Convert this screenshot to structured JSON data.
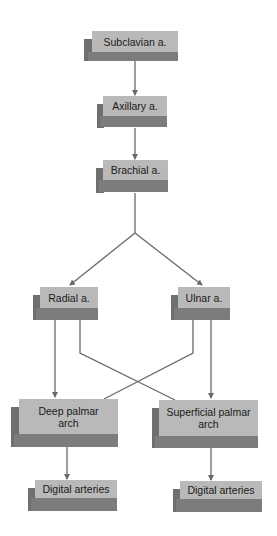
{
  "diagram": {
    "colors": {
      "face": "#b9b9b9",
      "side": "#6f6f6f",
      "bottom": "#7c7c7c",
      "line": "#6a6a6a",
      "text": "#1a1a1a"
    },
    "nodes": {
      "subclavian": {
        "label": "Subclavian a."
      },
      "axillary": {
        "label": "Axillary a."
      },
      "brachial": {
        "label": "Brachial a."
      },
      "radial": {
        "label": "Radial a."
      },
      "ulnar": {
        "label": "Ulnar a."
      },
      "deep_palmar": {
        "label": "Deep palmar arch"
      },
      "superficial_palmar": {
        "label": "Superficial palmar arch"
      },
      "digital_left": {
        "label": "Digital arteries"
      },
      "digital_right": {
        "label": "Digital arteries"
      }
    },
    "edges": [
      {
        "from": "Subclavian a.",
        "to": "Axillary a."
      },
      {
        "from": "Axillary a.",
        "to": "Brachial a."
      },
      {
        "from": "Brachial a.",
        "to": "Radial a."
      },
      {
        "from": "Brachial a.",
        "to": "Ulnar a."
      },
      {
        "from": "Radial a.",
        "to": "Deep palmar arch"
      },
      {
        "from": "Radial a.",
        "to": "Superficial palmar arch"
      },
      {
        "from": "Ulnar a.",
        "to": "Deep palmar arch"
      },
      {
        "from": "Ulnar a.",
        "to": "Superficial palmar arch"
      },
      {
        "from": "Deep palmar arch",
        "to": "Digital arteries"
      },
      {
        "from": "Superficial palmar arch",
        "to": "Digital arteries"
      }
    ]
  }
}
